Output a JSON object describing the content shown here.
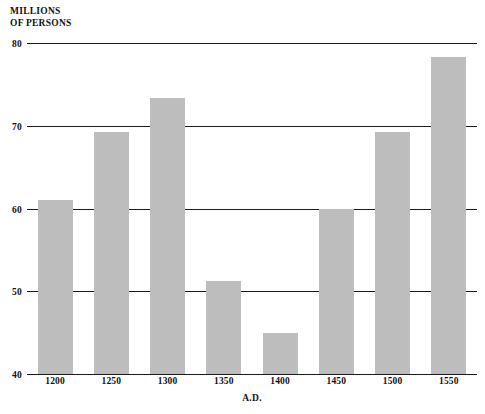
{
  "chart_data": {
    "type": "bar",
    "title": "",
    "ylabel": "MILLIONS\nOF PERSONS",
    "xlabel": "A.D.",
    "categories": [
      "1200",
      "1250",
      "1300",
      "1350",
      "1400",
      "1450",
      "1500",
      "1550"
    ],
    "values": [
      61.0,
      69.3,
      73.4,
      51.2,
      45.0,
      60.0,
      69.3,
      78.3
    ],
    "series": [
      {
        "name": "Population",
        "values": [
          61.0,
          69.3,
          73.4,
          51.2,
          45.0,
          60.0,
          69.3,
          78.3
        ]
      }
    ],
    "ylim": [
      40,
      80
    ],
    "ytick_labels": [
      "40",
      "50",
      "60",
      "70",
      "80"
    ],
    "ytick_values": [
      40,
      50,
      60,
      70,
      80
    ],
    "xlim_note": "categorical",
    "grid": "horizontal",
    "legend": "none",
    "bar_color": "#bdbdbd",
    "gridline_color": "#1a1a1a",
    "background_color": "#ffffff",
    "annotations": []
  },
  "figure": {
    "y_axis_title": "MILLIONS\nOF PERSONS",
    "x_axis_title": "A.D.",
    "source_note": ""
  }
}
